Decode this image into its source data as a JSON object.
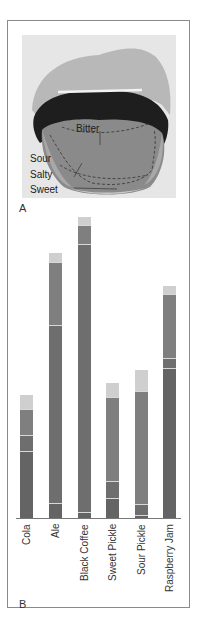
{
  "panel_a": {
    "label": "A",
    "tongue_labels": {
      "bitter": "Bitter",
      "sour": "Sour",
      "salty": "Salty",
      "sweet": "Sweet"
    }
  },
  "panel_b": {
    "label": "B"
  },
  "colors": {
    "light": "#cfcfcf",
    "medium": "#7f7f7f",
    "mid_dark": "#6e6e6e",
    "dark": "#646464",
    "separator": "#d8d8d8"
  },
  "chart_data": {
    "type": "bar",
    "stacked": true,
    "orientation": "vertical",
    "title": "",
    "xlabel": "",
    "ylabel": "",
    "categories": [
      "Cola",
      "Ale",
      "Black Coffee",
      "Sweet Pickle",
      "Sour Pickle",
      "Raspberry Jam"
    ],
    "note": "Values estimated as pixel heights of stacked segments from baseline (unlabeled axis); segments listed bottom to top",
    "bars": [
      {
        "category": "Cola",
        "x": 20,
        "segments": [
          66,
          16,
          26,
          15
        ]
      },
      {
        "category": "Ale",
        "x": 49,
        "segments": [
          14,
          178,
          63,
          10
        ]
      },
      {
        "category": "Black Coffee",
        "x": 78,
        "segments": [
          5,
          268,
          19,
          9
        ]
      },
      {
        "category": "Sweet Pickle",
        "x": 106,
        "segments": [
          19,
          17,
          84,
          15
        ]
      },
      {
        "category": "Sour Pickle",
        "x": 135,
        "segments": [
          2,
          11,
          113,
          22
        ]
      },
      {
        "category": "Raspberry Jam",
        "x": 163,
        "segments": [
          149,
          10,
          64,
          9
        ]
      }
    ],
    "segment_colors_bottom_to_top": [
      "dark",
      "mid_dark",
      "medium",
      "light"
    ],
    "grid": false,
    "legend": "none"
  }
}
